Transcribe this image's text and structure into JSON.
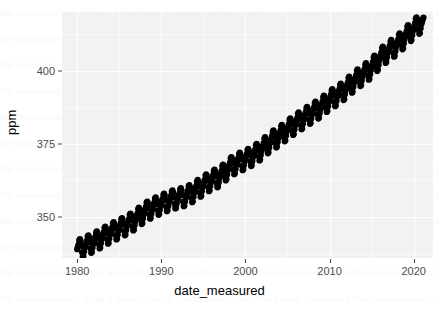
{
  "chart_data": {
    "type": "scatter",
    "title": "",
    "subtitle": "",
    "xlabel": "date_measured",
    "ylabel": "ppm",
    "xlim": [
      1978.2,
      2022.3
    ],
    "ylim": [
      336.0,
      420.0
    ],
    "grid": true,
    "legend": null,
    "point_color": "#000000",
    "panel_color": "#f2f2f2",
    "gridline_color": "#ffffff",
    "x_ticks": [
      1980,
      1990,
      2000,
      2010,
      2020
    ],
    "x_tick_labels": [
      "1980",
      "1990",
      "2000",
      "2010",
      "2020"
    ],
    "y_ticks": [
      350,
      375,
      400
    ],
    "y_tick_labels": [
      "350",
      "375",
      "400"
    ],
    "series_name": "Monthly mean CO2 (Mauna Loa)",
    "trend": {
      "start_year": 1980,
      "start_ppm": 338.5,
      "end_year": 2021.2,
      "end_ppm": 417.0
    },
    "seasonal_amplitude_ppm": 3.2,
    "points_per_year": 12,
    "annual_means": [
      {
        "year": 1980,
        "ppm": 338.8
      },
      {
        "year": 1981,
        "ppm": 340.1
      },
      {
        "year": 1982,
        "ppm": 341.4
      },
      {
        "year": 1983,
        "ppm": 343.0
      },
      {
        "year": 1984,
        "ppm": 344.6
      },
      {
        "year": 1985,
        "ppm": 346.0
      },
      {
        "year": 1986,
        "ppm": 347.4
      },
      {
        "year": 1987,
        "ppm": 349.2
      },
      {
        "year": 1988,
        "ppm": 351.6
      },
      {
        "year": 1989,
        "ppm": 353.1
      },
      {
        "year": 1990,
        "ppm": 354.4
      },
      {
        "year": 1991,
        "ppm": 355.6
      },
      {
        "year": 1992,
        "ppm": 356.4
      },
      {
        "year": 1993,
        "ppm": 357.1
      },
      {
        "year": 1994,
        "ppm": 358.8
      },
      {
        "year": 1995,
        "ppm": 360.8
      },
      {
        "year": 1996,
        "ppm": 362.6
      },
      {
        "year": 1997,
        "ppm": 363.7
      },
      {
        "year": 1998,
        "ppm": 366.7
      },
      {
        "year": 1999,
        "ppm": 368.4
      },
      {
        "year": 2000,
        "ppm": 369.6
      },
      {
        "year": 2001,
        "ppm": 371.1
      },
      {
        "year": 2002,
        "ppm": 373.2
      },
      {
        "year": 2003,
        "ppm": 375.8
      },
      {
        "year": 2004,
        "ppm": 377.5
      },
      {
        "year": 2005,
        "ppm": 379.8
      },
      {
        "year": 2006,
        "ppm": 381.9
      },
      {
        "year": 2007,
        "ppm": 383.8
      },
      {
        "year": 2008,
        "ppm": 385.6
      },
      {
        "year": 2009,
        "ppm": 387.4
      },
      {
        "year": 2010,
        "ppm": 389.9
      },
      {
        "year": 2011,
        "ppm": 391.6
      },
      {
        "year": 2012,
        "ppm": 393.9
      },
      {
        "year": 2013,
        "ppm": 396.5
      },
      {
        "year": 2014,
        "ppm": 398.6
      },
      {
        "year": 2015,
        "ppm": 400.8
      },
      {
        "year": 2016,
        "ppm": 404.2
      },
      {
        "year": 2017,
        "ppm": 406.6
      },
      {
        "year": 2018,
        "ppm": 408.6
      },
      {
        "year": 2019,
        "ppm": 411.4
      },
      {
        "year": 2020,
        "ppm": 414.2
      },
      {
        "year": 2021,
        "ppm": 416.5
      }
    ],
    "monthly_seasonal_offsets_ppm": [
      0.2,
      0.9,
      1.6,
      2.9,
      3.2,
      2.4,
      0.7,
      -1.6,
      -3.2,
      -3.1,
      -1.7,
      -0.5
    ]
  },
  "axes": {
    "y_title": "ppm",
    "x_title": "date_measured"
  }
}
